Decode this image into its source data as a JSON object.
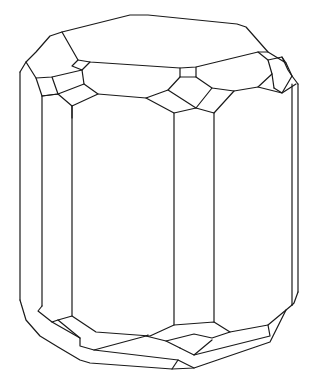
{
  "figure": {
    "title": "",
    "stroke_color": "#1a1a1a",
    "background_color": "#ffffff"
  }
}
